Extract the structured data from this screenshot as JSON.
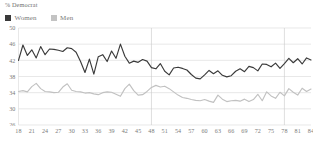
{
  "header": {
    "title": "% Democrat"
  },
  "legend": {
    "position": "top-left",
    "items": [
      {
        "label": "Women",
        "color": "#3a3a3a",
        "icon": "square-swatch"
      },
      {
        "label": "Men",
        "color": "#c3c3c3",
        "icon": "square-swatch"
      }
    ]
  },
  "colors": {
    "women_line": "#3a3a3a",
    "men_line": "#c1c1c1",
    "gridline": "#d8d8d8",
    "vertical_gridline": "#c9c9c9",
    "axis_text": "#7a7a7a",
    "title_text": "#6d6d6d",
    "background": "#ffffff"
  },
  "chart_data": {
    "type": "line",
    "title": "% Democrat",
    "xlabel": "",
    "ylabel": "",
    "xlim": [
      18,
      84
    ],
    "ylim": [
      26,
      50
    ],
    "grid": true,
    "grid_axis": "both",
    "legend_position": "top-left",
    "yticks": [
      26,
      30,
      34,
      38,
      42,
      46,
      50
    ],
    "ytick_labels": [
      "26",
      "30",
      "34",
      "38",
      "42",
      "46",
      "50"
    ],
    "xticks": [
      18,
      21,
      24,
      27,
      30,
      33,
      36,
      39,
      42,
      45,
      48,
      51,
      54,
      57,
      60,
      63,
      66,
      69,
      72,
      75,
      78,
      81,
      84
    ],
    "xtick_labels": [
      "18",
      "21",
      "24",
      "27",
      "30",
      "33",
      "36",
      "39",
      "42",
      "45",
      "48",
      "51",
      "54",
      "57",
      "60",
      "63",
      "66",
      "69",
      "72",
      "75",
      "78",
      "81",
      "84"
    ],
    "vertical_gridlines_at": [
      48,
      78
    ],
    "x": [
      18,
      19,
      20,
      21,
      22,
      23,
      24,
      25,
      26,
      27,
      28,
      29,
      30,
      31,
      32,
      33,
      34,
      35,
      36,
      37,
      38,
      39,
      40,
      41,
      42,
      43,
      44,
      45,
      46,
      47,
      48,
      49,
      50,
      51,
      52,
      53,
      54,
      55,
      56,
      57,
      58,
      59,
      60,
      61,
      62,
      63,
      64,
      65,
      66,
      67,
      68,
      69,
      70,
      71,
      72,
      73,
      74,
      75,
      76,
      77,
      78,
      79,
      80,
      81,
      82,
      83,
      84
    ],
    "series": [
      {
        "name": "Women",
        "color": "#3a3a3a",
        "values": [
          42.0,
          45.8,
          43.2,
          44.6,
          42.6,
          45.4,
          43.4,
          44.8,
          44.7,
          44.5,
          44.2,
          45.1,
          44.9,
          44.0,
          41.7,
          39.0,
          42.3,
          38.6,
          42.9,
          43.4,
          41.7,
          44.3,
          42.5,
          46.0,
          43.0,
          41.3,
          41.8,
          41.5,
          42.2,
          41.8,
          40.2,
          39.9,
          41.2,
          39.3,
          38.4,
          40.1,
          40.3,
          40.0,
          39.6,
          38.5,
          37.6,
          37.4,
          38.4,
          39.5,
          38.7,
          39.4,
          38.3,
          37.9,
          38.2,
          39.3,
          39.9,
          39.2,
          40.5,
          40.2,
          39.4,
          41.1,
          41.0,
          40.4,
          41.3,
          40.0,
          41.2,
          42.5,
          41.4,
          42.4,
          41.1,
          42.6,
          42.1
        ]
      },
      {
        "name": "Men",
        "color": "#c1c1c1",
        "values": [
          34.3,
          34.5,
          34.2,
          35.5,
          36.3,
          35.0,
          34.3,
          34.2,
          34.0,
          34.1,
          35.4,
          36.2,
          34.6,
          34.3,
          34.2,
          33.9,
          34.0,
          33.7,
          33.5,
          34.0,
          34.2,
          34.1,
          33.6,
          33.1,
          35.0,
          36.1,
          34.5,
          33.4,
          33.5,
          34.3,
          35.3,
          35.8,
          35.4,
          35.6,
          35.0,
          34.2,
          33.4,
          32.8,
          32.6,
          32.3,
          32.1,
          32.0,
          32.3,
          31.9,
          31.6,
          33.4,
          32.4,
          31.8,
          32.0,
          32.1,
          31.9,
          32.4,
          31.8,
          32.3,
          33.6,
          32.0,
          34.2,
          33.2,
          32.6,
          34.1,
          33.2,
          35.0,
          34.1,
          33.4,
          35.1,
          34.3,
          34.9
        ]
      }
    ]
  }
}
